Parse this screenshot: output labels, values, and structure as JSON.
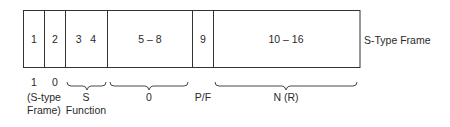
{
  "frame_label": "S-Type Frame",
  "fields": [
    {
      "bits": "1",
      "x0": 23,
      "x1": 44
    },
    {
      "bits": "2",
      "x0": 44,
      "x1": 65
    },
    {
      "bits": "3   4",
      "x0": 65,
      "x1": 107
    },
    {
      "bits": "5 – 8",
      "x0": 107,
      "x1": 192
    },
    {
      "bits": "9",
      "x0": 192,
      "x1": 213
    },
    {
      "bits": "10 – 16",
      "x0": 213,
      "x1": 360
    }
  ],
  "values": {
    "bit1": "1",
    "bit2": "0",
    "s_type_line1": "(S-type",
    "s_type_line2": "Frame)",
    "s_function_line1": "S",
    "s_function_line2": "Function",
    "zero": "0",
    "pf": "P/F",
    "nr": "N (R)"
  },
  "braces": [
    {
      "name": "s-function",
      "x0": 67,
      "x1": 106
    },
    {
      "name": "zero-bits",
      "x0": 110,
      "x1": 188
    },
    {
      "name": "nr-bits",
      "x0": 215,
      "x1": 357
    }
  ],
  "colors": {
    "line": "#333333",
    "text": "#2a2a2a"
  }
}
